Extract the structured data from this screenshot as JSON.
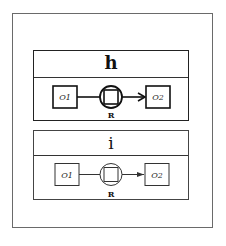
{
  "panels": [
    {
      "title": "h",
      "style": "bold",
      "nodes": {
        "left": "O1",
        "right": "O2",
        "relation": "R"
      }
    },
    {
      "title": "i",
      "style": "regular",
      "nodes": {
        "left": "O1",
        "right": "O2",
        "relation": "R"
      }
    }
  ],
  "colors": {
    "stroke": "#222222",
    "background": "#ffffff",
    "frame": "#6a6a6a"
  }
}
